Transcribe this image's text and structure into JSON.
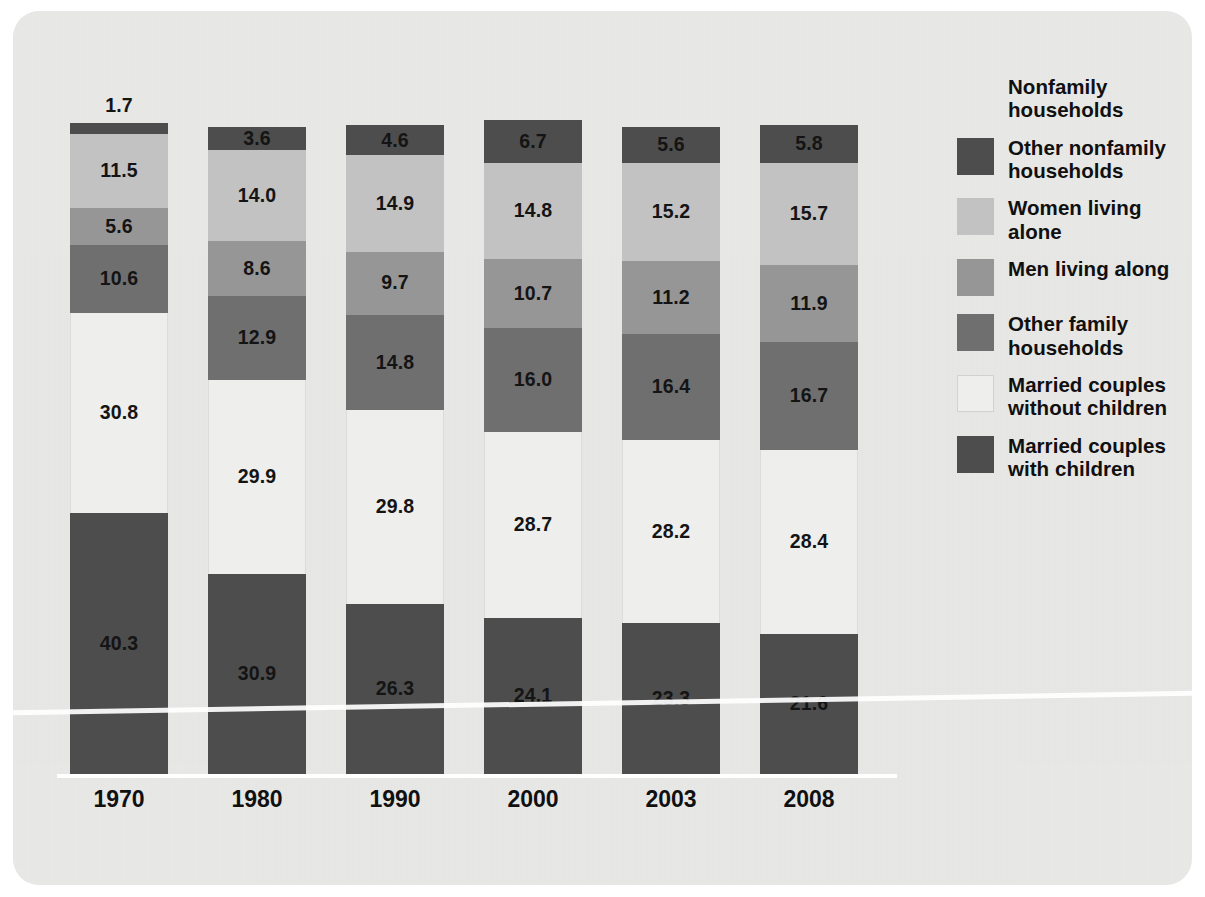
{
  "chart_data": {
    "type": "bar",
    "subtype": "stacked-bar-percent",
    "title": "",
    "xlabel": "",
    "ylabel": "",
    "ylim": [
      0,
      100
    ],
    "grid": false,
    "legend_position": "right",
    "categories": [
      "1970",
      "1980",
      "1990",
      "2000",
      "2003",
      "2008"
    ],
    "series": [
      {
        "name": "Married couples with children",
        "color": "#4d4d4d",
        "values": [
          40.3,
          30.9,
          26.3,
          24.1,
          23.3,
          21.6
        ]
      },
      {
        "name": "Married couples without children",
        "color": "#eeeeec",
        "values": [
          30.8,
          29.9,
          29.8,
          28.7,
          28.2,
          28.4
        ]
      },
      {
        "name": "Other family households",
        "color": "#6f6f6f",
        "values": [
          10.6,
          12.9,
          14.8,
          16.0,
          16.4,
          16.7
        ]
      },
      {
        "name": "Men living along",
        "color": "#969696",
        "values": [
          5.6,
          8.6,
          9.7,
          10.7,
          11.2,
          11.9
        ]
      },
      {
        "name": "Women living alone",
        "color": "#c2c2c2",
        "values": [
          11.5,
          14.0,
          14.9,
          14.8,
          15.2,
          15.7
        ]
      },
      {
        "name": "Other nonfamily households",
        "color": "#4d4d4d",
        "values": [
          1.7,
          3.6,
          4.6,
          6.7,
          5.6,
          5.8
        ]
      }
    ]
  },
  "bars": [
    {
      "year": "1970",
      "segments": [
        {
          "key": "other-nonfamily-households",
          "value": "1.7",
          "label_outside": true
        },
        {
          "key": "women-living-alone",
          "value": "11.5",
          "label_outside": false
        },
        {
          "key": "men-living-along",
          "value": "5.6",
          "label_outside": false
        },
        {
          "key": "other-family-households",
          "value": "10.6",
          "label_outside": false
        },
        {
          "key": "married-without-children",
          "value": "30.8",
          "label_outside": false
        },
        {
          "key": "married-with-children",
          "value": "40.3",
          "label_outside": false
        }
      ]
    },
    {
      "year": "1980",
      "segments": [
        {
          "key": "other-nonfamily-households",
          "value": "3.6",
          "label_outside": false
        },
        {
          "key": "women-living-alone",
          "value": "14.0",
          "label_outside": false
        },
        {
          "key": "men-living-along",
          "value": "8.6",
          "label_outside": false
        },
        {
          "key": "other-family-households",
          "value": "12.9",
          "label_outside": false
        },
        {
          "key": "married-without-children",
          "value": "29.9",
          "label_outside": false
        },
        {
          "key": "married-with-children",
          "value": "30.9",
          "label_outside": false
        }
      ]
    },
    {
      "year": "1990",
      "segments": [
        {
          "key": "other-nonfamily-households",
          "value": "4.6",
          "label_outside": false
        },
        {
          "key": "women-living-alone",
          "value": "14.9",
          "label_outside": false
        },
        {
          "key": "men-living-along",
          "value": "9.7",
          "label_outside": false
        },
        {
          "key": "other-family-households",
          "value": "14.8",
          "label_outside": false
        },
        {
          "key": "married-without-children",
          "value": "29.8",
          "label_outside": false
        },
        {
          "key": "married-with-children",
          "value": "26.3",
          "label_outside": false
        }
      ]
    },
    {
      "year": "2000",
      "segments": [
        {
          "key": "other-nonfamily-households",
          "value": "6.7",
          "label_outside": false
        },
        {
          "key": "women-living-alone",
          "value": "14.8",
          "label_outside": false
        },
        {
          "key": "men-living-along",
          "value": "10.7",
          "label_outside": false
        },
        {
          "key": "other-family-households",
          "value": "16.0",
          "label_outside": false
        },
        {
          "key": "married-without-children",
          "value": "28.7",
          "label_outside": false
        },
        {
          "key": "married-with-children",
          "value": "24.1",
          "label_outside": false
        }
      ]
    },
    {
      "year": "2003",
      "segments": [
        {
          "key": "other-nonfamily-households",
          "value": "5.6",
          "label_outside": false
        },
        {
          "key": "women-living-alone",
          "value": "15.2",
          "label_outside": false
        },
        {
          "key": "men-living-along",
          "value": "11.2",
          "label_outside": false
        },
        {
          "key": "other-family-households",
          "value": "16.4",
          "label_outside": false
        },
        {
          "key": "married-without-children",
          "value": "28.2",
          "label_outside": false
        },
        {
          "key": "married-with-children",
          "value": "23.3",
          "label_outside": false
        }
      ]
    },
    {
      "year": "2008",
      "segments": [
        {
          "key": "other-nonfamily-households",
          "value": "5.8",
          "label_outside": false
        },
        {
          "key": "women-living-alone",
          "value": "15.7",
          "label_outside": false
        },
        {
          "key": "men-living-along",
          "value": "11.9",
          "label_outside": false
        },
        {
          "key": "other-family-households",
          "value": "16.7",
          "label_outside": false
        },
        {
          "key": "married-without-children",
          "value": "28.4",
          "label_outside": false
        },
        {
          "key": "married-with-children",
          "value": "21.6",
          "label_outside": false
        }
      ]
    }
  ],
  "legend": {
    "items": [
      {
        "label": "Nonfamily\nhouseholds",
        "swatch": "none",
        "color": "",
        "name": "nonfamily-households"
      },
      {
        "label": "Other nonfamily\nhouseholds",
        "swatch": "filled",
        "color": "#4d4d4d",
        "name": "other-nonfamily-households"
      },
      {
        "label": "Women living alone",
        "swatch": "filled",
        "color": "#c2c2c2",
        "name": "women-living-alone"
      },
      {
        "label": "Men living along",
        "swatch": "filled",
        "color": "#969696",
        "name": "men-living-along"
      },
      {
        "label": "Other family\nhouseholds",
        "swatch": "filled",
        "color": "#6f6f6f",
        "name": "other-family-households"
      },
      {
        "label": "Married couples\nwithout children",
        "swatch": "hollow",
        "color": "#eeeeec",
        "name": "married-couples-without-children"
      },
      {
        "label": "Married couples\nwith children",
        "swatch": "filled",
        "color": "#4d4d4d",
        "name": "married-couples-with-children"
      }
    ]
  },
  "colors": {
    "panel_background": "#e8e8e6",
    "axis_line": "#ffffff",
    "label_text": "#141414",
    "dark": "#4d4d4d",
    "mid_dark": "#6f6f6f",
    "mid": "#969696",
    "light": "#c2c2c2",
    "near_white": "#eeeeec"
  }
}
